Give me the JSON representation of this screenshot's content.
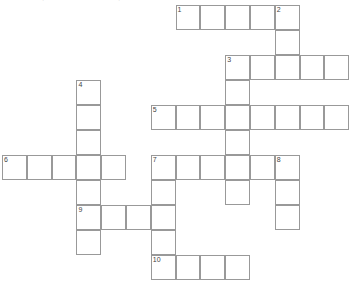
{
  "puzzle": {
    "type": "crossword-grid",
    "title": "",
    "grid": {
      "cell_size": 24.8,
      "row_height": 25,
      "origin_x": 2,
      "origin_y": 5,
      "columns": 14,
      "rows": 11,
      "border_color": "#999999",
      "cell_fill": "#ffffff",
      "number_color": "#444444"
    },
    "entries": [
      {
        "number": "1",
        "direction": "across",
        "col": 7,
        "row": 0,
        "length": 5
      },
      {
        "number": "2",
        "direction": "down",
        "col": 11,
        "row": 0,
        "length": 3
      },
      {
        "number": "3",
        "direction": "across",
        "col": 9,
        "row": 2,
        "length": 5
      },
      {
        "number": "3",
        "direction": "down",
        "col": 9,
        "row": 2,
        "length": 5
      },
      {
        "number": "4",
        "direction": "down",
        "col": 3,
        "row": 3,
        "length": 7
      },
      {
        "number": "5",
        "direction": "across",
        "col": 6,
        "row": 4,
        "length": 8
      },
      {
        "number": "6",
        "direction": "across",
        "col": 0,
        "row": 6,
        "length": 5
      },
      {
        "number": "7",
        "direction": "across",
        "col": 6,
        "row": 6,
        "length": 6
      },
      {
        "number": "7",
        "direction": "down",
        "col": 6,
        "row": 6,
        "length": 5
      },
      {
        "number": "8",
        "direction": "down",
        "col": 11,
        "row": 6,
        "length": 3
      },
      {
        "number": "9",
        "direction": "across",
        "col": 3,
        "row": 8,
        "length": 4
      },
      {
        "number": "10",
        "direction": "across",
        "col": 6,
        "row": 10,
        "length": 4
      }
    ],
    "cells": [
      {
        "col": 7,
        "row": 0,
        "number": "1"
      },
      {
        "col": 8,
        "row": 0,
        "number": ""
      },
      {
        "col": 9,
        "row": 0,
        "number": ""
      },
      {
        "col": 10,
        "row": 0,
        "number": ""
      },
      {
        "col": 11,
        "row": 0,
        "number": "2"
      },
      {
        "col": 11,
        "row": 1,
        "number": ""
      },
      {
        "col": 9,
        "row": 2,
        "number": "3"
      },
      {
        "col": 10,
        "row": 2,
        "number": ""
      },
      {
        "col": 11,
        "row": 2,
        "number": ""
      },
      {
        "col": 12,
        "row": 2,
        "number": ""
      },
      {
        "col": 13,
        "row": 2,
        "number": ""
      },
      {
        "col": 3,
        "row": 3,
        "number": "4"
      },
      {
        "col": 9,
        "row": 3,
        "number": ""
      },
      {
        "col": 3,
        "row": 4,
        "number": ""
      },
      {
        "col": 6,
        "row": 4,
        "number": "5"
      },
      {
        "col": 7,
        "row": 4,
        "number": ""
      },
      {
        "col": 8,
        "row": 4,
        "number": ""
      },
      {
        "col": 9,
        "row": 4,
        "number": ""
      },
      {
        "col": 10,
        "row": 4,
        "number": ""
      },
      {
        "col": 11,
        "row": 4,
        "number": ""
      },
      {
        "col": 12,
        "row": 4,
        "number": ""
      },
      {
        "col": 13,
        "row": 4,
        "number": ""
      },
      {
        "col": 3,
        "row": 5,
        "number": ""
      },
      {
        "col": 9,
        "row": 5,
        "number": ""
      },
      {
        "col": 0,
        "row": 6,
        "number": "6"
      },
      {
        "col": 1,
        "row": 6,
        "number": ""
      },
      {
        "col": 2,
        "row": 6,
        "number": ""
      },
      {
        "col": 3,
        "row": 6,
        "number": ""
      },
      {
        "col": 4,
        "row": 6,
        "number": ""
      },
      {
        "col": 6,
        "row": 6,
        "number": "7"
      },
      {
        "col": 7,
        "row": 6,
        "number": ""
      },
      {
        "col": 8,
        "row": 6,
        "number": ""
      },
      {
        "col": 9,
        "row": 6,
        "number": ""
      },
      {
        "col": 10,
        "row": 6,
        "number": ""
      },
      {
        "col": 11,
        "row": 6,
        "number": "8"
      },
      {
        "col": 3,
        "row": 7,
        "number": ""
      },
      {
        "col": 6,
        "row": 7,
        "number": ""
      },
      {
        "col": 9,
        "row": 7,
        "number": ""
      },
      {
        "col": 11,
        "row": 7,
        "number": ""
      },
      {
        "col": 3,
        "row": 8,
        "number": "9"
      },
      {
        "col": 4,
        "row": 8,
        "number": ""
      },
      {
        "col": 5,
        "row": 8,
        "number": ""
      },
      {
        "col": 6,
        "row": 8,
        "number": ""
      },
      {
        "col": 11,
        "row": 8,
        "number": ""
      },
      {
        "col": 3,
        "row": 9,
        "number": ""
      },
      {
        "col": 6,
        "row": 9,
        "number": ""
      },
      {
        "col": 6,
        "row": 10,
        "number": "10"
      },
      {
        "col": 7,
        "row": 10,
        "number": ""
      },
      {
        "col": 8,
        "row": 10,
        "number": ""
      },
      {
        "col": 9,
        "row": 10,
        "number": ""
      }
    ],
    "top_artifacts": [
      {
        "x": 42,
        "y": -3,
        "text": "·"
      },
      {
        "x": 118,
        "y": -3,
        "text": "·"
      }
    ]
  }
}
